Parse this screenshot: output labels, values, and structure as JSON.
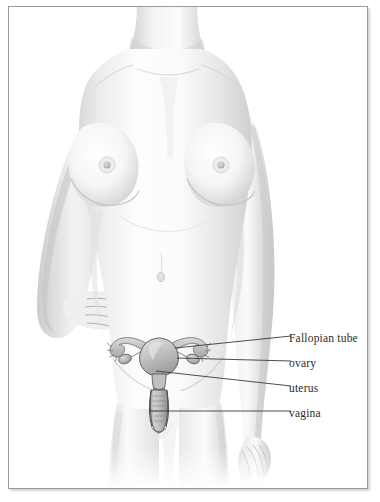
{
  "illustration": {
    "title": "Female reproductive anatomy",
    "style": "grayscale pencil rendering of a female torso, front view, with internal reproductive organs overlaid on the pelvis",
    "subject": "female figure, cropped at the neck and mid-thigh, left hand resting on hip, right arm hanging down"
  },
  "frame": {
    "border_color": "#9a9a9a",
    "background_color": "#ffffff"
  },
  "labels": [
    {
      "id": "fallopian-tube",
      "text": "Fallopian tube",
      "text_x": 288,
      "text_y": 333,
      "leader": {
        "x1": 166,
        "y1": 341,
        "x2": 282,
        "y2": 330
      }
    },
    {
      "id": "ovary",
      "text": "ovary",
      "text_x": 288,
      "text_y": 358,
      "leader": {
        "x1": 168,
        "y1": 350,
        "x2": 282,
        "y2": 355
      }
    },
    {
      "id": "uterus",
      "text": "uterus",
      "text_x": 288,
      "text_y": 383,
      "leader": {
        "x1": 147,
        "y1": 364,
        "x2": 282,
        "y2": 380
      }
    },
    {
      "id": "vagina",
      "text": "vagina",
      "text_x": 288,
      "text_y": 408,
      "leader": {
        "x1": 141,
        "y1": 404,
        "x2": 282,
        "y2": 405
      }
    }
  ],
  "anatomy_parts": [
    {
      "id": "fallopian-tube-left",
      "name": "left fallopian tube"
    },
    {
      "id": "fallopian-tube-right",
      "name": "right fallopian tube"
    },
    {
      "id": "ovary-left",
      "name": "left ovary"
    },
    {
      "id": "ovary-right",
      "name": "right ovary"
    },
    {
      "id": "uterus-body",
      "name": "uterine body"
    },
    {
      "id": "cervix",
      "name": "cervix"
    },
    {
      "id": "vaginal-canal",
      "name": "vaginal canal"
    }
  ],
  "colors": {
    "skin_light": "#fbfbfb",
    "skin_shade": "#dcdcdc",
    "skin_deep": "#b9b9b9",
    "organ_fill": "#c9c9c9",
    "organ_line": "#5a5a5a",
    "leader_line": "#3a3a3a",
    "label_text": "#2b2b2b"
  }
}
